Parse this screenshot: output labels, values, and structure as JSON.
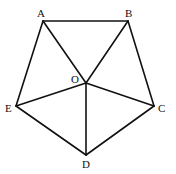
{
  "diagram": {
    "type": "geometry",
    "points": {
      "A": {
        "x": 43,
        "y": 21,
        "label": "A",
        "lx": 37,
        "ly": 17
      },
      "B": {
        "x": 128,
        "y": 21,
        "label": "B",
        "lx": 125,
        "ly": 17
      },
      "C": {
        "x": 154,
        "y": 106,
        "label": "C",
        "lx": 158,
        "ly": 112
      },
      "D": {
        "x": 86,
        "y": 155,
        "label": "D",
        "lx": 82,
        "ly": 168
      },
      "E": {
        "x": 16,
        "y": 106,
        "label": "E",
        "lx": 5,
        "ly": 112
      },
      "O": {
        "x": 86,
        "y": 83,
        "label": "O",
        "lx": 71,
        "ly": 83
      }
    },
    "edges": [
      [
        "A",
        "B"
      ],
      [
        "B",
        "C"
      ],
      [
        "C",
        "D"
      ],
      [
        "D",
        "E"
      ],
      [
        "E",
        "A"
      ],
      [
        "O",
        "A"
      ],
      [
        "O",
        "B"
      ],
      [
        "O",
        "C"
      ],
      [
        "O",
        "D"
      ],
      [
        "O",
        "E"
      ]
    ],
    "stroke_color": "#111111"
  }
}
